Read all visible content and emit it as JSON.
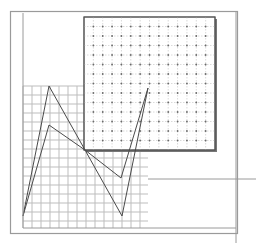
{
  "canvas": {
    "width": 256,
    "height": 243,
    "background": "#ffffff"
  },
  "colors": {
    "frame": "#9a9a9a",
    "grid_line": "#bdbdbd",
    "dot_grid_line": "#d0d0d0",
    "dot": "#6a6a6a",
    "panel_border": "#555555",
    "panel_shadow": "#777777",
    "polyline": "#4a4a4a"
  },
  "outer_frame": {
    "x": 10,
    "y": 11,
    "w": 227,
    "h": 222
  },
  "left_guide": {
    "x": 23,
    "y1": 13,
    "y2": 228
  },
  "right_guide_vertical": {
    "x": 236,
    "y1": 11,
    "y2": 243
  },
  "right_guide_horizontal": {
    "y": 179,
    "x1": 148,
    "x2": 256
  },
  "bottom_guide": {
    "y": 228,
    "x1": 23,
    "x2": 236
  },
  "square_grid_panel": {
    "x": 23,
    "y": 86,
    "w": 125,
    "h": 142,
    "step": 9
  },
  "dot_grid_panel": {
    "x": 84,
    "y": 17,
    "w": 131,
    "h": 133,
    "step": 9.3
  },
  "polylines": [
    {
      "name": "zigzag-outer",
      "points": "23,216 49,86 85,150 122,216 148,88"
    },
    {
      "name": "zigzag-inner",
      "points": "23,216 49,125 85,150 121,178 148,88"
    }
  ]
}
